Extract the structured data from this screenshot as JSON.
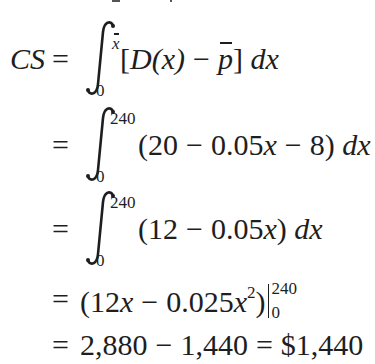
{
  "document": {
    "type": "calculus-derivation",
    "subject": "Consumers' surplus",
    "lines": [
      {
        "id": "line-1",
        "lhs": "CS",
        "equals": "=",
        "integral": {
          "lower": "0",
          "upper": "x"
        },
        "integrand": {
          "open": "[",
          "func": "D(x)",
          "minus": "−",
          "pbar": "p",
          "close": "]",
          "dx": "dx"
        }
      },
      {
        "id": "line-2",
        "equals": "=",
        "integral": {
          "lower": "0",
          "upper": "240"
        },
        "integrand": "(20 − 0.05x − 8)",
        "integrand_parts": [
          "(20",
          "−",
          "0.05",
          "x",
          "−",
          "8)"
        ],
        "dx": "dx"
      },
      {
        "id": "line-3",
        "equals": "=",
        "integral": {
          "lower": "0",
          "upper": "240"
        },
        "integrand": "(12 − 0.05x)",
        "integrand_parts": [
          "(12",
          "−",
          "0.05",
          "x",
          ")"
        ],
        "dx": "dx"
      },
      {
        "id": "line-4",
        "equals": "=",
        "antiderivative_parts": [
          "(12",
          "x",
          "−",
          "0.025",
          "x",
          "2",
          ")"
        ],
        "evaluation": {
          "lower": "0",
          "upper": "240"
        }
      },
      {
        "id": "line-5",
        "equals": "=",
        "first": "2,880",
        "minus": "−",
        "second": "1,440",
        "equals2": "=",
        "result": "$1,440"
      }
    ]
  },
  "colors": {
    "text": "#1e1e1e",
    "background": "#ffffff"
  }
}
